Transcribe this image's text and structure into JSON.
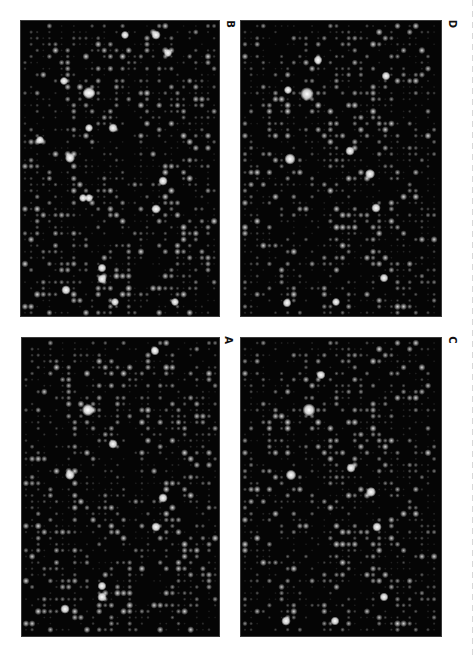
{
  "figure": {
    "panels": [
      {
        "id": "B",
        "label": "B",
        "box": {
          "x": 20,
          "y": 20,
          "w": 200,
          "h": 297
        },
        "label_pos": {
          "x": 224,
          "y": 18
        },
        "seed": 11,
        "bright_spots": [
          [
            68,
            72,
            4.2
          ],
          [
            135,
            14,
            3.2
          ],
          [
            92,
            107,
            3.2
          ],
          [
            49,
            137,
            3.4
          ],
          [
            142,
            160,
            3.2
          ],
          [
            135,
            188,
            3.2
          ],
          [
            81,
            247,
            3
          ],
          [
            81,
            258,
            3.2
          ],
          [
            45,
            269,
            3.2
          ],
          [
            104,
            14,
            2.8
          ],
          [
            147,
            32,
            2.8
          ],
          [
            43,
            60,
            2.8
          ],
          [
            68,
            107,
            2.8
          ],
          [
            19,
            119,
            2.8
          ],
          [
            62,
            177,
            2.8
          ],
          [
            68,
            177,
            2.8
          ],
          [
            94,
            281,
            2.8
          ],
          [
            154,
            281,
            2.8
          ]
        ]
      },
      {
        "id": "D",
        "label": "D",
        "box": {
          "x": 240,
          "y": 20,
          "w": 202,
          "h": 297
        },
        "label_pos": {
          "x": 446,
          "y": 18
        },
        "seed": 23,
        "bright_spots": [
          [
            66,
            73,
            4.6
          ],
          [
            49,
            138,
            3.8
          ],
          [
            109,
            130,
            3.2
          ],
          [
            129,
            153,
            3.4
          ],
          [
            135,
            187,
            3.2
          ],
          [
            143,
            257,
            3
          ],
          [
            46,
            282,
            3
          ],
          [
            77,
            39,
            3
          ],
          [
            145,
            55,
            3
          ],
          [
            47,
            69,
            2.8
          ],
          [
            95,
            281,
            2.8
          ]
        ]
      },
      {
        "id": "A",
        "label": "A",
        "box": {
          "x": 21,
          "y": 337,
          "w": 199,
          "h": 300
        },
        "label_pos": {
          "x": 222,
          "y": 334
        },
        "seed": 11,
        "bright_spots": [
          [
            66,
            72,
            4.2
          ],
          [
            48,
            137,
            3.4
          ],
          [
            91,
            106,
            3.2
          ],
          [
            141,
            160,
            3.2
          ],
          [
            134,
            189,
            3.2
          ],
          [
            80,
            259,
            3.2
          ],
          [
            80,
            248,
            3
          ],
          [
            43,
            271,
            3.2
          ],
          [
            133,
            13,
            3
          ]
        ]
      },
      {
        "id": "C",
        "label": "C",
        "box": {
          "x": 240,
          "y": 337,
          "w": 202,
          "h": 300
        },
        "label_pos": {
          "x": 446,
          "y": 334
        },
        "seed": 23,
        "bright_spots": [
          [
            68,
            72,
            4.4
          ],
          [
            50,
            137,
            3.6
          ],
          [
            110,
            130,
            3.2
          ],
          [
            130,
            154,
            3.4
          ],
          [
            136,
            189,
            3.2
          ],
          [
            143,
            259,
            3
          ],
          [
            45,
            283,
            3.2
          ],
          [
            94,
            283,
            3
          ],
          [
            80,
            37,
            3
          ]
        ]
      }
    ],
    "grid": {
      "pitch": 6.1,
      "offset_x": 4,
      "offset_y": 5
    },
    "colors": {
      "background": "#ffffff",
      "panel_bg": "#050505",
      "spot": "#ffffff",
      "label": "#111111"
    }
  }
}
